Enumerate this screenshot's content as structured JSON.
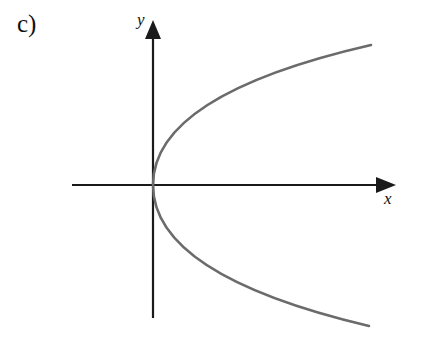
{
  "figure": {
    "part_label": "c)",
    "x_axis_label": "x",
    "y_axis_label": "y",
    "curve": {
      "description": "sideways parabola opening right, vertex at origin (x = k*y^2)",
      "color": "#6b6b6b"
    },
    "axis_color": "#1a1a1a"
  }
}
